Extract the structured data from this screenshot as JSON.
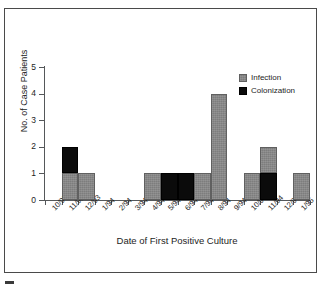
{
  "chart_data": {
    "type": "bar",
    "title": "",
    "subtitle": "",
    "xlabel": "Date of First Positive Culture",
    "ylabel": "No. of Case Patients",
    "ylim": [
      0,
      5
    ],
    "yticks": [
      0,
      1,
      2,
      3,
      4,
      5
    ],
    "grid": false,
    "stacked": true,
    "legend_position": "top-right-inside",
    "categories": [
      "10/93",
      "11/93",
      "12/93",
      "1/94",
      "2/94",
      "3/94",
      "4/94",
      "5/94",
      "6/94",
      "7/94",
      "8/94",
      "9/94",
      "10/94",
      "11/94",
      "12/94",
      "1/95"
    ],
    "series": [
      {
        "name": "Infection",
        "color": "#7d7d7d",
        "values": [
          0,
          1,
          1,
          0,
          0,
          0,
          1,
          0,
          0,
          1,
          4,
          0,
          1,
          1,
          0,
          1
        ]
      },
      {
        "name": "Colonization",
        "color": "#0b0b0b",
        "values": [
          0,
          1,
          0,
          0,
          0,
          0,
          0,
          1,
          1,
          0,
          0,
          0,
          0,
          1,
          0,
          0
        ]
      }
    ],
    "totals": [
      0,
      2,
      1,
      0,
      0,
      0,
      1,
      1,
      1,
      1,
      4,
      0,
      1,
      2,
      0,
      1
    ]
  },
  "axes": {
    "y_title": "No. of Case Patients",
    "x_title": "Date of First Positive Culture",
    "y_tick_labels": [
      "0",
      "1",
      "2",
      "3",
      "4",
      "5"
    ],
    "x_tick_labels": [
      "10/93",
      "11/93",
      "12/93",
      "1/94",
      "2/94",
      "3/94",
      "4/94",
      "5/94",
      "6/94",
      "7/94",
      "8/94",
      "9/94",
      "10/94",
      "11/94",
      "12/94",
      "1/95"
    ]
  },
  "legend": {
    "entries": [
      {
        "label": "Infection",
        "color": "#7d7d7d",
        "pattern": "hatched-gray"
      },
      {
        "label": "Colonization",
        "color": "#0b0b0b",
        "pattern": "solid-black"
      }
    ]
  },
  "style": {
    "frame_color": "#4a4a4a",
    "axis_color": "#55585a",
    "text_color": "#1d1d1d",
    "background": "#ffffff"
  }
}
